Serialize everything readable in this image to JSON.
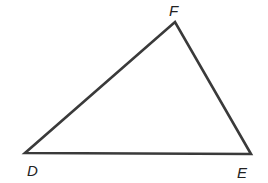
{
  "diagram": {
    "type": "triangle",
    "stroke_color": "#3a3a3a",
    "vertices": [
      {
        "label": "D",
        "x": 25,
        "y": 153,
        "label_x": 27,
        "label_y": 176
      },
      {
        "label": "E",
        "x": 251,
        "y": 154,
        "label_x": 237,
        "label_y": 178
      },
      {
        "label": "F",
        "x": 175,
        "y": 22,
        "label_x": 169,
        "label_y": 16
      }
    ]
  }
}
